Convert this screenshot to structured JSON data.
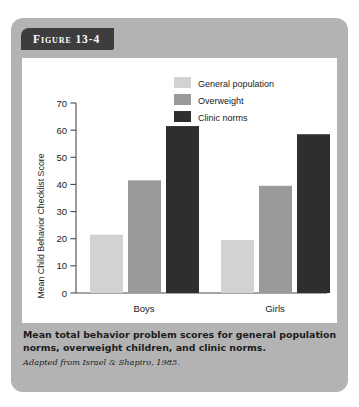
{
  "figure": {
    "tab_label": "Figure 13-4",
    "caption_title": "Mean total behavior problem scores for general population norms, overweight children, and clinic norms.",
    "caption_source": "Adapted from Israel & Shapiro, 1985."
  },
  "colors": {
    "card_background": "#b3b3b3",
    "tab_background": "#3d3d3d",
    "panel_background": "#ffffff",
    "general_population": "#d2d2d2",
    "overweight": "#9a9a9a",
    "clinic_norms": "#2e2e2e",
    "axis": "#4a4a4a",
    "text": "#1a1a1a"
  },
  "chart_data": {
    "type": "bar",
    "title": "",
    "categories": [
      "Boys",
      "Girls"
    ],
    "series": [
      {
        "name": "General population",
        "values": [
          21.5,
          19.5
        ],
        "color": "#d2d2d2"
      },
      {
        "name": "Overweight",
        "values": [
          41.5,
          39.5
        ],
        "color": "#9a9a9a"
      },
      {
        "name": "Clinic norms",
        "values": [
          61.5,
          58.5
        ],
        "color": "#2e2e2e"
      }
    ],
    "xlabel": "",
    "ylabel": "Mean Child Behavior Checklist Score",
    "ylim": [
      0,
      70
    ],
    "yticks": [
      0,
      10,
      20,
      30,
      40,
      50,
      60,
      70
    ],
    "ytick_labels": [
      "0",
      "10",
      "20",
      "30",
      "40",
      "50",
      "60",
      "70"
    ],
    "grid": false,
    "legend_position": "top-right"
  }
}
